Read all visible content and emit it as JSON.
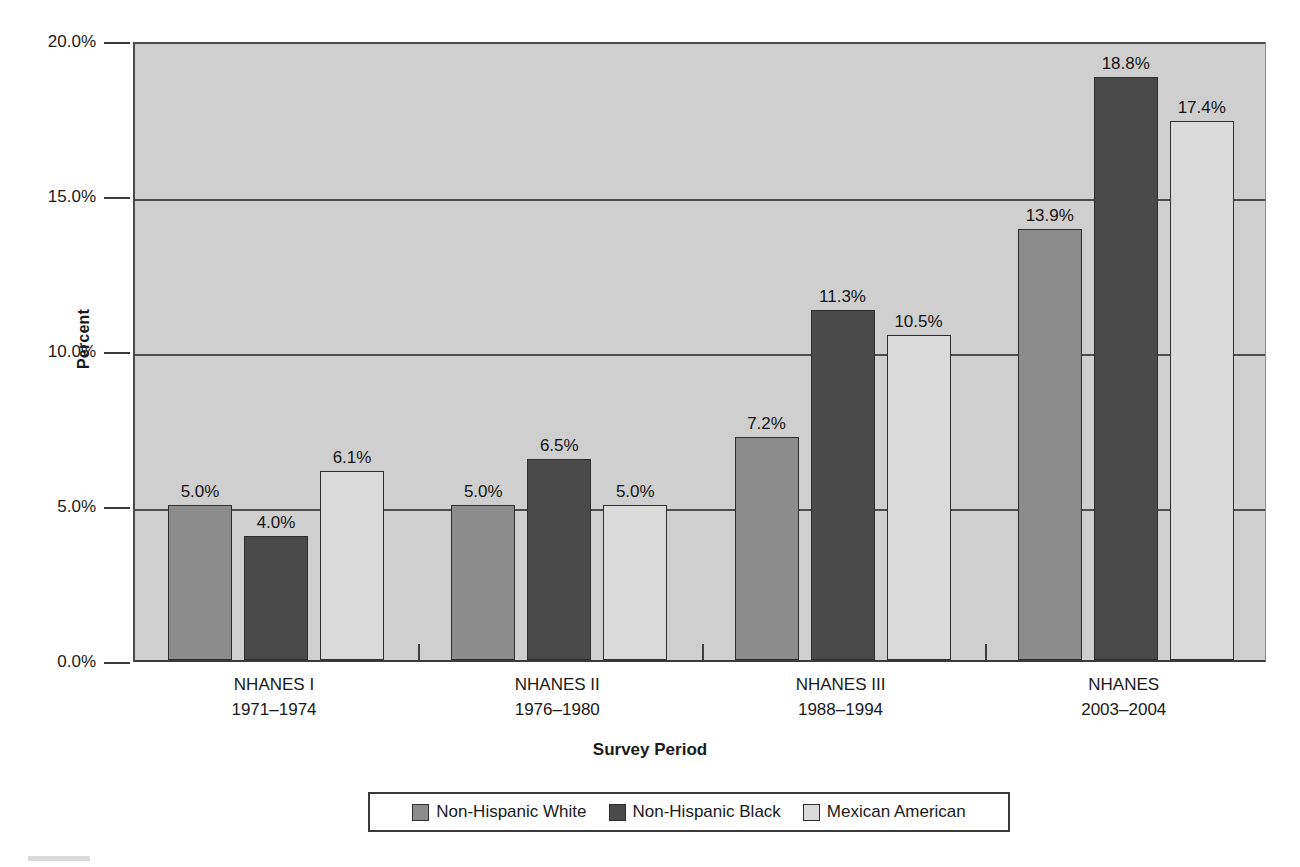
{
  "chart_data": {
    "type": "bar",
    "title": "",
    "xlabel": "Survey Period",
    "ylabel": "Percent",
    "ylim": [
      0,
      20
    ],
    "ytick_labels": [
      "0.0%",
      "5.0%",
      "10.0%",
      "15.0%",
      "20.0%"
    ],
    "ytick_values": [
      0,
      5,
      10,
      15,
      20
    ],
    "grid": "horizontal",
    "legend_position": "bottom",
    "categories": [
      "NHANES I\n1971–1974",
      "NHANES II\n1976–1980",
      "NHANES III\n1988–1994",
      "NHANES\n2003–2004"
    ],
    "category_lines": [
      [
        "NHANES I",
        "1971–1974"
      ],
      [
        "NHANES II",
        "1976–1980"
      ],
      [
        "NHANES III",
        "1988–1994"
      ],
      [
        "NHANES",
        "2003–2004"
      ]
    ],
    "series": [
      {
        "name": "Non-Hispanic White",
        "color": "#8c8c8c",
        "values": [
          5.0,
          5.0,
          7.2,
          13.9
        ],
        "labels": [
          "5.0%",
          "5.0%",
          "7.2%",
          "13.9%"
        ]
      },
      {
        "name": "Non-Hispanic Black",
        "color": "#4a4a4a",
        "values": [
          4.0,
          6.5,
          11.3,
          18.8
        ],
        "labels": [
          "4.0%",
          "6.5%",
          "11.3%",
          "18.8%"
        ]
      },
      {
        "name": "Mexican American",
        "color": "#dadada",
        "values": [
          6.1,
          5.0,
          10.5,
          17.4
        ],
        "labels": [
          "6.1%",
          "5.0%",
          "10.5%",
          "17.4%"
        ]
      }
    ],
    "colors": {
      "plot_background": "#cfcfcf",
      "axis": "#3a3a3a",
      "gridline": "#4c4c4c",
      "text": "#141414"
    }
  }
}
